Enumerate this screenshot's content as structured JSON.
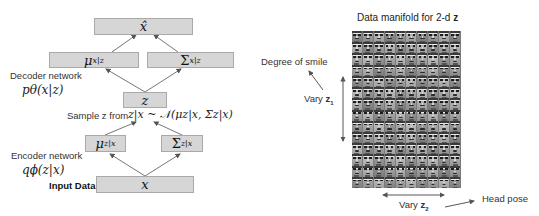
{
  "left_diagram": {
    "boxes": {
      "x_hat": "x̂",
      "mu_x_given_z": {
        "base": "μ",
        "sub": "x|z"
      },
      "sigma_x_given_z": {
        "base": "Σ",
        "sub": "x|z"
      },
      "z": "z",
      "mu_z_given_x": {
        "base": "μ",
        "sub": "z|x"
      },
      "sigma_z_given_x": {
        "base": "Σ",
        "sub": "z|x"
      },
      "x": "x"
    },
    "labels": {
      "decoder_network": "Decoder network",
      "decoder_formula": "pθ(x|z)",
      "sample_text": "Sample z from",
      "sample_formula": "z|x ~ 𝒩(μz|x, Σz|x)",
      "encoder_network": "Encoder network",
      "encoder_formula": "qϕ(z|x)",
      "input_data": "Input Data"
    },
    "colors": {
      "box_fill": "#d6d6d6",
      "box_border": "#a9a9a9",
      "arrow": "#555555"
    }
  },
  "right_diagram": {
    "title": "Data manifold for 2-d",
    "title_bold": "z",
    "grid": {
      "columns": 10,
      "rows": 14,
      "content": "grayscale face thumbnails"
    },
    "labels": {
      "degree_of_smile": "Degree of smile",
      "vary_z1": "Vary",
      "vary_z1_var": "z",
      "vary_z1_sub": "1",
      "vary_z2": "Vary",
      "vary_z2_var": "z",
      "vary_z2_sub": "2",
      "head_pose": "Head pose"
    }
  }
}
